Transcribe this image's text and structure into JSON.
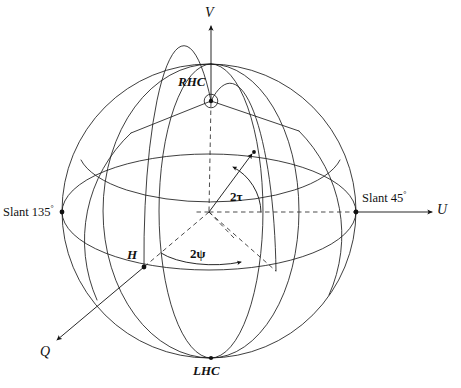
{
  "figure": {
    "kind": "poincare-sphere-diagram",
    "background_color": "#ffffff",
    "line_color": "#1c1c1c",
    "width": 461,
    "height": 388
  },
  "axes": [
    {
      "id": "v",
      "label": "V",
      "direction": "up",
      "x": 211,
      "y": 16
    },
    {
      "id": "u",
      "label": "U",
      "direction": "right",
      "x": 443,
      "y": 213
    },
    {
      "id": "q",
      "label": "Q",
      "direction": "down-left",
      "x": 44,
      "y": 355
    }
  ],
  "points": [
    {
      "id": "rhc",
      "label": "RHC",
      "description": "right-hand circular polarization, north pole",
      "x": 211,
      "y": 101,
      "label_x": 181,
      "label_y": 76
    },
    {
      "id": "lhc",
      "label": "LHC",
      "description": "left-hand circular polarization, south pole",
      "x": 211,
      "y": 358,
      "label_x": 195,
      "label_y": 364
    },
    {
      "id": "h",
      "label": "H",
      "description": "horizontal linear polarization",
      "x": 144,
      "y": 267,
      "label_x": 129,
      "label_y": 248
    },
    {
      "id": "slant45",
      "label": "Slant 45",
      "degree_symbol": "°",
      "x": 356,
      "y": 212,
      "label_x": 362,
      "label_y": 197
    },
    {
      "id": "slant135",
      "label": "Slant 135",
      "degree_symbol": "°",
      "x": 62,
      "y": 212,
      "label_x": 3,
      "label_y": 205
    }
  ],
  "angles": [
    {
      "id": "two-tau",
      "label": "2τ",
      "description": "ellipticity angle arc measured from equatorial plane",
      "label_x": 233,
      "label_y": 191
    },
    {
      "id": "two-psi",
      "label": "2ψ",
      "description": "orientation angle arc measured in equatorial plane",
      "label_x": 193,
      "label_y": 248
    }
  ],
  "sphere": {
    "center_x": 209,
    "center_y": 211,
    "radius": 147
  }
}
